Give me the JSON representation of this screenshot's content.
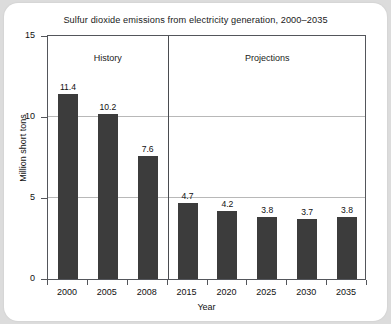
{
  "chart_data": {
    "type": "bar",
    "title": "Sulfur dioxide emissions from electricity generation, 2000–2035",
    "xlabel": "Year",
    "ylabel": "Million short tons",
    "categories": [
      "2000",
      "2005",
      "2008",
      "2015",
      "2020",
      "2025",
      "2030",
      "2035"
    ],
    "values": [
      11.4,
      10.2,
      7.6,
      4.7,
      4.2,
      3.8,
      3.7,
      3.8
    ],
    "data_labels": [
      "11.4",
      "10.2",
      "7.6",
      "4.7",
      "4.2",
      "3.8",
      "3.7",
      "3.8"
    ],
    "ylim": [
      0,
      15
    ],
    "yticks": [
      0,
      5,
      10,
      15
    ],
    "ytick_labels": [
      "0",
      "5",
      "10",
      "15"
    ],
    "grid": "horizontal",
    "legend": "none",
    "bar_color": "#3c3c3c",
    "gridline_color": "#b8b8b8",
    "axis_color": "#54565b",
    "annotations": [
      {
        "label": "History",
        "span": [
          "2000",
          "2008"
        ]
      },
      {
        "label": "Projections",
        "span": [
          "2015",
          "2035"
        ]
      }
    ],
    "divider_after_category": "2008"
  },
  "sections": {
    "history_label": "History",
    "projections_label": "Projections"
  }
}
